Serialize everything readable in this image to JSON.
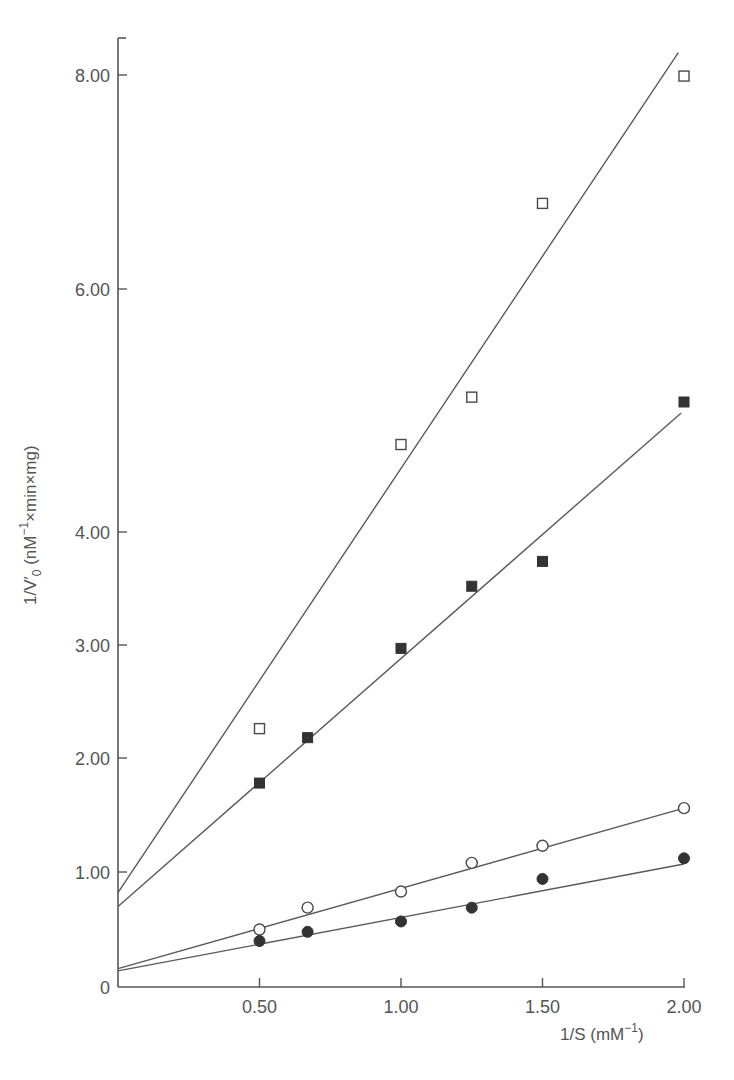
{
  "chart_data": {
    "type": "line",
    "subtype": "lineweaver-burk double reciprocal plot",
    "title": "",
    "xlabel": "1/S (mM⁻¹)",
    "xlabel_parts": {
      "main": "1/S (mM",
      "sup": "−1",
      "tail": ")"
    },
    "ylabel": "1/V′0 (nM⁻¹×min×mg)",
    "ylabel_parts": {
      "main": "1/V′",
      "sub": "0",
      "mid": " (nM",
      "sup": "−1",
      "tail": "×min×mg)"
    },
    "xlim": [
      0,
      2.0
    ],
    "ylim": [
      0,
      8.6
    ],
    "grid": false,
    "legend": null,
    "x_ticks": [
      {
        "value": 0.5,
        "label": "0.50"
      },
      {
        "value": 1.0,
        "label": "1.00"
      },
      {
        "value": 1.5,
        "label": "1.50"
      },
      {
        "value": 2.0,
        "label": "2.00"
      }
    ],
    "y_ticks": [
      {
        "value": 0,
        "label": "0"
      },
      {
        "value": 1,
        "label": "1.00"
      },
      {
        "value": 2,
        "label": "2.00"
      },
      {
        "value": 3,
        "label": "3.00"
      },
      {
        "value": 4,
        "label": "4.00"
      },
      {
        "value": 6,
        "label": "6.00"
      },
      {
        "value": 8,
        "label": "8.00"
      }
    ],
    "x": [
      0.5,
      0.67,
      1.0,
      1.25,
      1.5,
      2.0
    ],
    "series": [
      {
        "name": "open squares",
        "marker": "square-open",
        "values": [
          2.26,
          null,
          4.72,
          5.11,
          6.8,
          7.99
        ],
        "points": [
          [
            0.5,
            2.26
          ],
          [
            1.0,
            4.72
          ],
          [
            1.25,
            5.11
          ],
          [
            1.5,
            6.8
          ],
          [
            2.0,
            7.99
          ]
        ],
        "fit_line": {
          "x0": 0,
          "y0": 0.82,
          "x1": 1.98,
          "y1": 8.21
        }
      },
      {
        "name": "filled squares",
        "marker": "square-filled",
        "values": [
          1.78,
          2.18,
          2.97,
          3.52,
          3.74,
          5.07
        ],
        "points": [
          [
            0.5,
            1.78
          ],
          [
            0.67,
            2.18
          ],
          [
            1.0,
            2.97
          ],
          [
            1.25,
            3.52
          ],
          [
            1.5,
            3.74
          ],
          [
            2.0,
            5.07
          ]
        ],
        "fit_line": {
          "x0": 0,
          "y0": 0.7,
          "x1": 1.99,
          "y1": 4.98
        }
      },
      {
        "name": "open circles",
        "marker": "circle-open",
        "values": [
          0.5,
          0.69,
          0.83,
          1.08,
          1.23,
          1.56
        ],
        "points": [
          [
            0.5,
            0.5
          ],
          [
            0.67,
            0.69
          ],
          [
            1.0,
            0.83
          ],
          [
            1.25,
            1.08
          ],
          [
            1.5,
            1.23
          ],
          [
            2.0,
            1.56
          ]
        ],
        "fit_line": {
          "x0": 0,
          "y0": 0.16,
          "x1": 2.0,
          "y1": 1.56
        }
      },
      {
        "name": "filled circles",
        "marker": "circle-filled",
        "values": [
          0.4,
          0.48,
          0.57,
          0.69,
          0.94,
          1.12
        ],
        "points": [
          [
            0.5,
            0.4
          ],
          [
            0.67,
            0.48
          ],
          [
            1.0,
            0.57
          ],
          [
            1.25,
            0.69
          ],
          [
            1.5,
            0.94
          ],
          [
            2.0,
            1.12
          ]
        ],
        "fit_line": {
          "x0": 0,
          "y0": 0.14,
          "x1": 2.0,
          "y1": 1.07
        }
      }
    ],
    "colors": {
      "axis": "#555555",
      "line": "#5a5a5a",
      "marker_filled": "#333333",
      "marker_open_stroke": "#4a4a4a",
      "text": "#555555"
    }
  }
}
